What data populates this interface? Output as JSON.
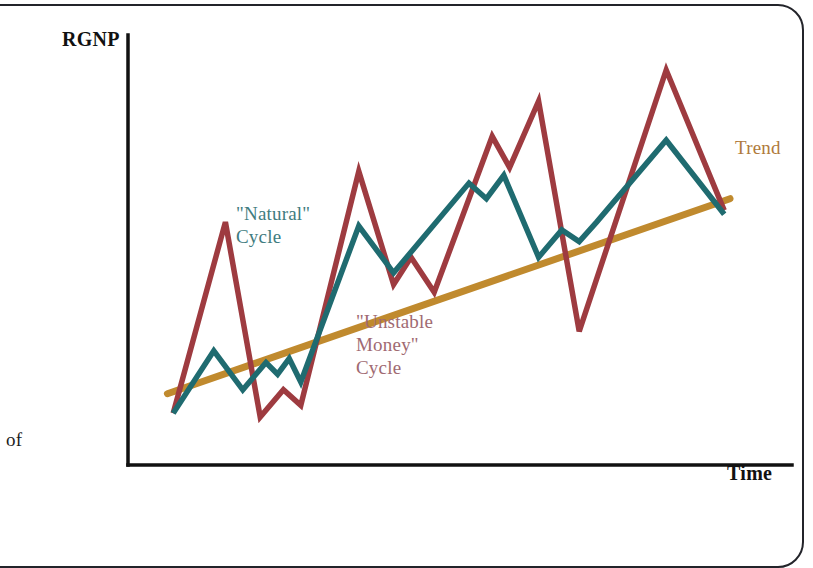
{
  "figure": {
    "margin_note": "of",
    "axes": {
      "y_label": "RGNP",
      "x_label": "Time"
    },
    "annotations": {
      "natural": "\"Natural\"\nCycle",
      "unstable": "\"Unstable\nMoney\"\nCycle",
      "trend": "Trend"
    },
    "colors": {
      "natural_cycle": "#1f6b70",
      "unstable_money_cycle": "#9e3b40",
      "trend": "#c08a2e",
      "axis": "#111111",
      "natural_label": "#3f7c80",
      "unstable_label": "#a06a72",
      "trend_label": "#b07a3c",
      "page_border": "#23242a",
      "background": "#ffffff"
    }
  },
  "chart_data": {
    "type": "line",
    "title": "",
    "xlabel": "Time",
    "ylabel": "RGNP",
    "xlim": [
      0,
      100
    ],
    "ylim": [
      0,
      100
    ],
    "grid": false,
    "legend_position": "inline-annotations",
    "axis_ticks": {
      "x": [],
      "y": []
    },
    "note": "Schematic diagram: real GNP fluctuating around a rising long-run trend. Two cyclical paths are drawn: a milder \"Natural\" cycle and a larger-amplitude \"Unstable Money\" cycle. Values are schematic (no numeric scale is printed on the axes); x/y are percentages of the plotting box, y measured upward.",
    "series": [
      {
        "name": "\"Unstable Money\" Cycle",
        "color": "#9e3b40",
        "x": [
          4,
          13,
          19,
          23,
          26,
          36,
          42,
          45,
          49,
          59,
          62,
          67,
          74,
          89,
          99
        ],
        "y": [
          12,
          61,
          11,
          18,
          14,
          74,
          45,
          52,
          43,
          83,
          75,
          92,
          33,
          100,
          64
        ]
      },
      {
        "name": "\"Natural\" Cycle",
        "color": "#1f6b70",
        "x": [
          4,
          11,
          16,
          20,
          22,
          24,
          26,
          36,
          42,
          55,
          58,
          61,
          67,
          71,
          74,
          77,
          89,
          99
        ],
        "y": [
          12,
          28,
          18,
          25,
          22,
          26,
          20,
          60,
          48,
          71,
          67,
          73,
          52,
          59,
          56,
          61,
          82,
          63
        ]
      },
      {
        "name": "Trend",
        "color": "#c08a2e",
        "x": [
          3,
          100
        ],
        "y": [
          17,
          67
        ],
        "style": "straight-line"
      }
    ]
  }
}
